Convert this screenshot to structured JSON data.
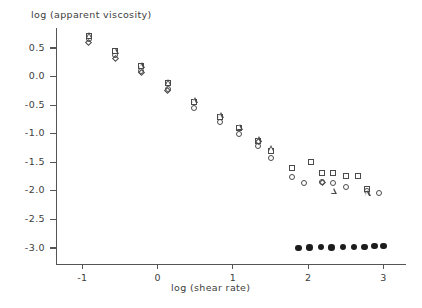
{
  "chart_data": {
    "type": "scatter",
    "title": "",
    "xlabel": "log (shear rate)",
    "ylabel": "log (apparent viscosity)",
    "xlim": [
      -1.35,
      3.3
    ],
    "ylim": [
      -3.28,
      0.85
    ],
    "xticks": [
      -1,
      0,
      1,
      2,
      3
    ],
    "xtick_labels": [
      "-1",
      "0",
      "1",
      "2",
      "3"
    ],
    "yticks": [
      0.5,
      0.0,
      -0.5,
      -1.0,
      -1.5,
      -2.0,
      -2.5,
      -3.0
    ],
    "ytick_labels": [
      "0.5",
      "0.0",
      "-0.5",
      "-1.0",
      "-1.5",
      "-2.0",
      "-2.5",
      "-3.0"
    ],
    "grid": false,
    "legend": "none",
    "marker_types": [
      "square",
      "circle",
      "triangle",
      "diamond",
      "filled-circle"
    ],
    "series": [
      {
        "name": "square",
        "marker": "square",
        "points": [
          [
            -0.9,
            0.69
          ],
          [
            -0.55,
            0.42
          ],
          [
            -0.2,
            0.16
          ],
          [
            0.15,
            -0.14
          ],
          [
            0.5,
            -0.46
          ],
          [
            0.85,
            -0.72
          ],
          [
            1.1,
            -0.92
          ],
          [
            1.35,
            -1.14
          ],
          [
            1.52,
            -1.32
          ],
          [
            1.8,
            -1.62
          ],
          [
            2.05,
            -1.52
          ],
          [
            2.2,
            -1.7
          ],
          [
            2.35,
            -1.7
          ],
          [
            2.52,
            -1.76
          ],
          [
            2.68,
            -1.76
          ],
          [
            2.8,
            -1.98
          ]
        ]
      },
      {
        "name": "circle",
        "marker": "circle",
        "points": [
          [
            -0.9,
            0.64
          ],
          [
            -0.55,
            0.35
          ],
          [
            -0.2,
            0.08
          ],
          [
            0.15,
            -0.23
          ],
          [
            0.5,
            -0.57
          ],
          [
            0.85,
            -0.82
          ],
          [
            1.1,
            -1.02
          ],
          [
            1.35,
            -1.24
          ],
          [
            1.52,
            -1.44
          ],
          [
            1.8,
            -1.78
          ],
          [
            1.96,
            -1.88
          ],
          [
            2.2,
            -1.86
          ],
          [
            2.35,
            -1.88
          ],
          [
            2.52,
            -1.96
          ],
          [
            2.8,
            -2.02
          ],
          [
            2.95,
            -2.06
          ]
        ]
      },
      {
        "name": "triangle",
        "marker": "triangle",
        "points": [
          [
            -0.9,
            0.72
          ],
          [
            -0.55,
            0.45
          ],
          [
            -0.2,
            0.2
          ],
          [
            0.15,
            -0.1
          ],
          [
            0.5,
            -0.42
          ],
          [
            0.85,
            -0.68
          ],
          [
            1.1,
            -0.88
          ],
          [
            1.35,
            -1.1
          ],
          [
            1.52,
            -1.26
          ],
          [
            2.35,
            -2.0
          ],
          [
            2.8,
            -2.04
          ]
        ]
      },
      {
        "name": "diamond",
        "marker": "diamond",
        "points": [
          [
            -0.9,
            0.57
          ],
          [
            -0.55,
            0.3
          ],
          [
            -0.2,
            0.05
          ],
          [
            0.15,
            -0.26
          ],
          [
            1.35,
            -1.16
          ],
          [
            2.2,
            -1.88
          ]
        ]
      },
      {
        "name": "filled-circle",
        "marker": "filled-circle",
        "points": [
          [
            1.87,
            -3.0
          ],
          [
            2.02,
            -2.99
          ],
          [
            2.17,
            -2.98
          ],
          [
            2.31,
            -2.99
          ],
          [
            2.46,
            -2.98
          ],
          [
            2.61,
            -2.98
          ],
          [
            2.75,
            -2.98
          ],
          [
            2.88,
            -2.97
          ],
          [
            3.0,
            -2.97
          ]
        ]
      }
    ]
  },
  "colors": {
    "axis": "#555555",
    "marker_outline": "#4a4a4a",
    "marker_fill": "#1c1c1c",
    "text": "#3d3d3d",
    "background": "#ffffff"
  }
}
